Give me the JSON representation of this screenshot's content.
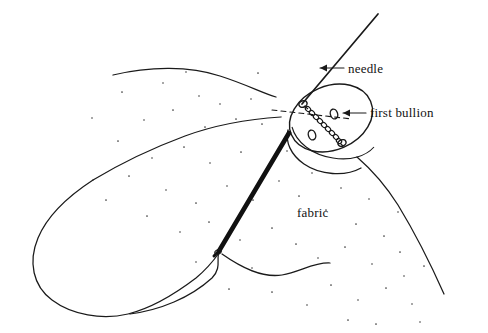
{
  "figure": {
    "background_color": "#ffffff",
    "ink_color": "#1a1a1a",
    "thread_color": "#111111",
    "width": 488,
    "height": 333
  },
  "labels": {
    "needle": "needle",
    "first_bullion": "first bullion",
    "fabric": "fabric"
  },
  "callouts": [
    {
      "name": "needle",
      "text": "needle",
      "arrow_from": [
        344,
        68
      ],
      "arrow_to": [
        313,
        68
      ],
      "points_at": "needle-shaft"
    },
    {
      "name": "first-bullion",
      "text": "first bullion",
      "arrow_from": [
        366,
        113
      ],
      "arrow_to": [
        340,
        113
      ],
      "points_at": "bullion-coil"
    },
    {
      "name": "fabric",
      "text": "fabric",
      "arrow_from": null,
      "arrow_to": null,
      "points_at": "fabric-surface"
    }
  ],
  "elements": {
    "fabric_patch": {
      "name": "fabric-patch",
      "style": "stippled outline",
      "stipple_dot_color": "#3a3a3a"
    },
    "button": {
      "name": "button",
      "shape": "ellipse",
      "center": [
        330,
        117
      ],
      "rx": 42,
      "ry": 33,
      "rotation_deg": -24,
      "hole_count": 4
    },
    "needle": {
      "name": "needle",
      "tip_at": [
        302,
        103
      ],
      "tail_at": [
        378,
        14
      ]
    },
    "bullion": {
      "name": "first-bullion-coil",
      "coil_count": 11,
      "from_hole": [
        303,
        104
      ],
      "to_hole": [
        343,
        147
      ]
    },
    "thread": {
      "name": "working-thread",
      "from": [
        288,
        134
      ],
      "to": [
        217,
        252
      ]
    }
  }
}
